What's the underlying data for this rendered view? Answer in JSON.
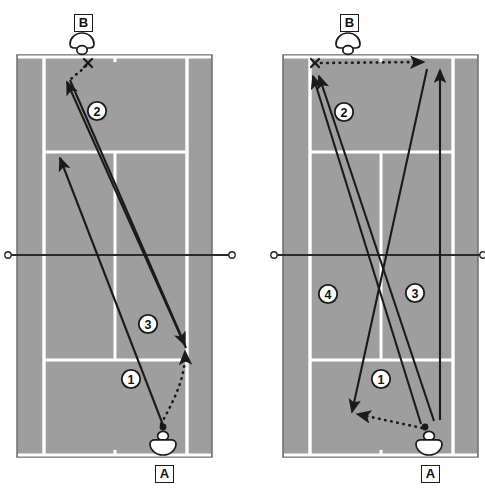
{
  "figure": {
    "court_surface_color": "#9e9e9e",
    "court_line_color": "#ffffff",
    "court_border_color": "#6e6e6e",
    "stroke_color": "#1a1a1a",
    "badge_fill": "#ffffff"
  },
  "panels": [
    {
      "id": "left-panel",
      "name": "court-diagram-left",
      "court": {
        "outer": {
          "x": 17,
          "y": 55,
          "w": 195,
          "h": 402
        },
        "singles_left_x": 44,
        "singles_right_x": 187,
        "service_line_top_y": 152,
        "service_line_bottom_y": 360,
        "center_line_x": 115,
        "net_y": 255,
        "net_post_left_x": 8,
        "net_post_right_x": 232,
        "center_mark_top_y": 57,
        "center_mark_bottom_y": 455
      },
      "players": [
        {
          "label": "B",
          "name": "player-b",
          "label_x": 74,
          "label_y": 14,
          "icon_x": 82,
          "icon_y": 42,
          "facing": "down"
        },
        {
          "label": "A",
          "name": "player-a",
          "label_x": 155,
          "label_y": 466,
          "icon_x": 163,
          "icon_y": 441,
          "facing": "up"
        }
      ],
      "marks": [
        {
          "type": "x-mark",
          "name": "ball-bounce-mark",
          "x": 88,
          "y": 63
        },
        {
          "type": "dot",
          "name": "ball-contact-dot",
          "x": 163,
          "y": 427
        }
      ],
      "shots": [
        {
          "badge": "1",
          "name": "shot-1",
          "badge_x": 131,
          "badge_y": 379,
          "style": "solid",
          "path": "M163,425 L60,158",
          "description": "A cross-court drive deep to B side"
        },
        {
          "badge": "2",
          "name": "shot-2",
          "badge_x": 97,
          "badge_y": 111,
          "style": "solid",
          "path": "M186,348 L67,82",
          "description": "Deep drive from right corner to far corner"
        },
        {
          "badge": "3",
          "name": "shot-3",
          "badge_x": 148,
          "badge_y": 324,
          "style": "solid",
          "path": "M70,80 L185,345",
          "description": "Return drive back down the line"
        },
        {
          "badge": "",
          "name": "ball-feed-dotted",
          "style": "dotted",
          "path": "M161,424 C172,400 184,376 184,352",
          "description": "Dotted ball path from A up court"
        },
        {
          "badge": "",
          "name": "ball-bounce-dotted",
          "style": "dotted",
          "path": "M85,66 C80,72 74,76 70,80",
          "description": "Short dotted path from X mark"
        }
      ]
    },
    {
      "id": "right-panel",
      "name": "court-diagram-right",
      "court": {
        "outer": {
          "x": 283,
          "y": 55,
          "w": 195,
          "h": 402
        },
        "singles_left_x": 310,
        "singles_right_x": 453,
        "service_line_top_y": 152,
        "service_line_bottom_y": 360,
        "center_line_x": 381,
        "net_y": 255,
        "net_post_left_x": 274,
        "net_post_right_x": 484,
        "center_mark_top_y": 57,
        "center_mark_bottom_y": 455
      },
      "players": [
        {
          "label": "B",
          "name": "player-b",
          "label_x": 340,
          "label_y": 14,
          "icon_x": 348,
          "icon_y": 42,
          "facing": "down"
        },
        {
          "label": "A",
          "name": "player-a",
          "label_x": 421,
          "label_y": 466,
          "icon_x": 429,
          "icon_y": 441,
          "facing": "up"
        }
      ],
      "marks": [
        {
          "type": "x-mark",
          "name": "ball-bounce-mark",
          "x": 315,
          "y": 63
        },
        {
          "type": "dot",
          "name": "ball-contact-dot",
          "x": 425,
          "y": 427
        }
      ],
      "shots": [
        {
          "badge": "1",
          "name": "shot-1",
          "badge_x": 381,
          "badge_y": 379,
          "style": "solid",
          "path": "M421,424 L313,76",
          "description": "Deep drive from A to far left corner"
        },
        {
          "badge": "2",
          "name": "shot-2",
          "badge_x": 344,
          "badge_y": 112,
          "style": "solid",
          "path": "M434,421 L319,76",
          "description": "Second deep drive to far left corner"
        },
        {
          "badge": "3",
          "name": "shot-3",
          "badge_x": 415,
          "badge_y": 293,
          "style": "solid",
          "path": "M440,420 L440,70",
          "description": "Straight drive down the line"
        },
        {
          "badge": "4",
          "name": "shot-4",
          "badge_x": 328,
          "badge_y": 294,
          "style": "solid",
          "path": "M427,69 L352,412",
          "description": "Drive from far corner to near left corner"
        },
        {
          "badge": "",
          "name": "ball-feed-dotted",
          "style": "dotted",
          "path": "M422,428 L356,414",
          "description": "Dotted path toward left corner"
        },
        {
          "badge": "",
          "name": "ball-return-dotted",
          "style": "dotted",
          "path": "M320,63 L427,62",
          "description": "Dotted horizontal path across the baseline"
        }
      ]
    }
  ],
  "caption": {
    "text": ""
  }
}
